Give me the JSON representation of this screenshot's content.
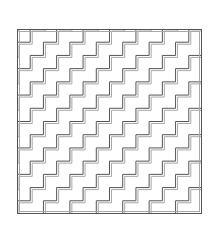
{
  "figure": {
    "square": {
      "x": 17,
      "y": 29,
      "size": 185
    },
    "pattern": {
      "period": 26.43,
      "step": 13.21,
      "repeats_x": 7,
      "repeats_y": 7,
      "line_offset": 2
    },
    "colors": {
      "background": "#ffffff",
      "primary_line": "#555555",
      "secondary_line": "#a8a8a8",
      "border": "#555555"
    }
  }
}
